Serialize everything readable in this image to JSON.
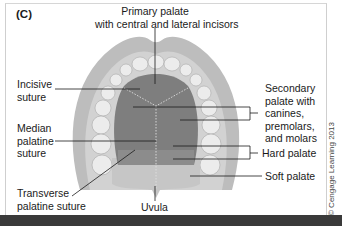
{
  "figure": {
    "panel_label": "(C)",
    "copyright": "© Cengage Learning 2013"
  },
  "labels": {
    "primary_palate": [
      "Primary palate",
      "with central and lateral incisors"
    ],
    "incisive_suture": [
      "Incisive",
      "suture"
    ],
    "median_palatine_suture": [
      "Median",
      "palatine",
      "suture"
    ],
    "transverse_palatine_suture": [
      "Transverse",
      "palatine suture"
    ],
    "uvula": "Uvula",
    "secondary_palate": [
      "Secondary",
      "palate with",
      "canines,",
      "premolars,",
      "and molars"
    ],
    "hard_palate": "Hard palate",
    "soft_palate": "Soft palate"
  },
  "colors": {
    "gum_outer": "#b9b9b9",
    "gum_inner": "#d4d4d4",
    "teeth": "#e9e9e9",
    "hard_palate": "#7c7c7c",
    "soft_palate": "#c4c4c4",
    "bottom_bar": "#3a3a3a"
  }
}
